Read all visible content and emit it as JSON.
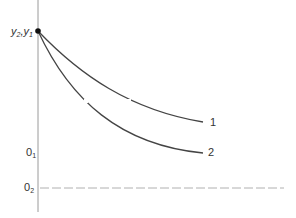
{
  "diagram": {
    "type": "decay-curves",
    "axis": {
      "origin_label_top": "y2,y1"
    },
    "labels": {
      "y_top_main": "y",
      "y_top_sub1": "2",
      "y_top_sep": ",",
      "y_top_main2": "y",
      "y_top_sub2": "1",
      "q1_main": "0",
      "q1_sub": "1",
      "q2_main": "0",
      "q2_sub": "2"
    },
    "curves": [
      {
        "id": "1",
        "label": "1",
        "end_level": "upper"
      },
      {
        "id": "2",
        "label": "2",
        "end_level": "lower"
      }
    ],
    "baseline": {
      "label": "0₂",
      "style": "dashed"
    },
    "colors": {
      "line": "#444444",
      "axis": "#999999",
      "dashed": "#aaaaaa",
      "dot": "#111111"
    }
  }
}
